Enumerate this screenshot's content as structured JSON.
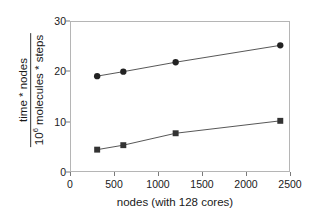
{
  "chart_data": {
    "type": "line",
    "title": "",
    "xlabel": "nodes (with 128 cores)",
    "ylabel_numerator": "time * nodes",
    "ylabel_denominator_prefix": "10",
    "ylabel_denominator_exponent": "6",
    "ylabel_denominator_rest": " molecules * steps",
    "ylabel_full": "time * nodes / 10^6 molecules * steps",
    "x": [
      300,
      600,
      1200,
      2400
    ],
    "xlim": [
      0,
      2500
    ],
    "ylim": [
      0,
      30
    ],
    "xticks": [
      "0",
      "500",
      "1000",
      "1500",
      "2000",
      "2500"
    ],
    "xtick_values": [
      0,
      500,
      1000,
      1500,
      2000,
      2500
    ],
    "yticks": [
      "0",
      "10",
      "20",
      "30"
    ],
    "ytick_values": [
      0,
      10,
      20,
      30
    ],
    "grid": false,
    "legend": "none",
    "series": [
      {
        "name": "upper-series",
        "marker": "circle",
        "color": "#222222",
        "values": [
          19.1,
          20.0,
          21.9,
          25.3
        ]
      },
      {
        "name": "lower-series",
        "marker": "square",
        "color": "#333333",
        "values": [
          4.3,
          5.2,
          7.6,
          10.1
        ]
      }
    ]
  },
  "colors": {
    "axis": "#b5b5b5",
    "tick": "#7a7a7a",
    "line": "#555555",
    "marker": "#222222",
    "text": "#1a1a1a",
    "background": "#ffffff"
  }
}
